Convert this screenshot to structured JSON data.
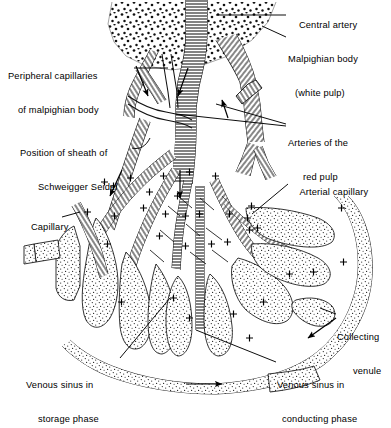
{
  "figure": {
    "background_color": "#ffffff",
    "ink_color": "#000000",
    "stipple_color": "#1a1a1a",
    "width": 391,
    "height": 400
  },
  "labels": [
    {
      "key": "central_artery",
      "text": "Central artery",
      "lines": [
        "Central artery"
      ],
      "x": 288,
      "y": 11,
      "align": "left",
      "leader": "line from label to the large vertical hatched vessel at top center"
    },
    {
      "key": "malpighian_body",
      "text": "Malpighian body (white pulp)",
      "lines": [
        "Malpighian body",
        "(white pulp)"
      ],
      "x": 288,
      "y": 33,
      "align": "left",
      "leader": "line from label to the stippled wedge region at top"
    },
    {
      "key": "peripheral_capillaries",
      "text": "Peripheral capillaries of malpighian body",
      "lines": [
        "Peripheral capillaries",
        "of malpighian body"
      ],
      "x": 10,
      "y": 50,
      "align": "left",
      "leader": "horizontal dash to branching vessels at lower-left of white pulp"
    },
    {
      "key": "arteries_red_pulp",
      "text": "Arteries of the red pulp",
      "lines": [
        "Arteries of the",
        "red pulp"
      ],
      "x": 288,
      "y": 117,
      "align": "left",
      "leader": "two converging lines to hatched arteries in mid-upper diagram"
    },
    {
      "key": "sheath_schweigger_seidel",
      "text": "Position of sheath of Schweigger Seidel",
      "lines": [
        "Position of sheath of",
        "Schweigger Seidel"
      ],
      "x": 22,
      "y": 127,
      "align": "left",
      "leader": "curved hook line to a sheathed capillary segment"
    },
    {
      "key": "arterial_capillary",
      "text": "Arterial capillary",
      "lines": [
        "Arterial capillary"
      ],
      "x": 289,
      "y": 178,
      "align": "left",
      "leader": "diagonal line down-left to capillary entering a sinus"
    },
    {
      "key": "capillary",
      "text": "Capillary",
      "lines": [
        "Capillary"
      ],
      "x": 20,
      "y": 213,
      "align": "left",
      "leader": "short dash to a hatched capillary on the left margin"
    },
    {
      "key": "collecting_venule",
      "text": "Collecting venule",
      "lines": [
        "Collecting",
        "venule"
      ],
      "x": 337,
      "y": 311,
      "align": "left",
      "leader": "short dash left to the outer collecting venule band"
    },
    {
      "key": "venous_sinus_conducting",
      "text": "Venous sinus in conducting phase",
      "lines": [
        "Venous sinus in",
        "conducting phase"
      ],
      "x": 277,
      "y": 359,
      "align": "left",
      "leader": "line up-left into an open (conducting) sinus"
    },
    {
      "key": "venous_sinus_storage",
      "text": "Venous sinus in storage phase",
      "lines": [
        "Venous sinus in",
        "storage phase"
      ],
      "x": 26,
      "y": 359,
      "align": "left",
      "leader": "line up-right into a distended (storage) sinus"
    }
  ],
  "annotations": {
    "plus_marks_meaning": "+",
    "plus_mark_count": 34,
    "flow_arrows_count": 7,
    "flow_arrow_note": "solid arrowheads indicating direction of blood flow"
  },
  "legend_note": ""
}
